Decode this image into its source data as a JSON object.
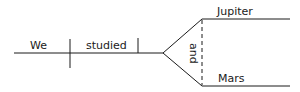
{
  "diagram": {
    "type": "sentence-diagram",
    "subject": "We",
    "verb": "studied",
    "conjunction": "and",
    "objects": [
      "Jupiter",
      "Mars"
    ],
    "line_color": "#1a1a1a"
  }
}
